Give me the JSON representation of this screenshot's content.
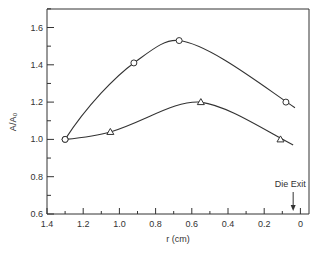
{
  "chart_data": {
    "type": "line",
    "title": "",
    "xlabel": "r (cm)",
    "ylabel": "A/A₀",
    "xlim": [
      1.4,
      0
    ],
    "ylim": [
      0.6,
      1.7
    ],
    "x_ticks": [
      "1.4",
      "1.2",
      "1.0",
      "0.8",
      "0.6",
      "0.4",
      "0.2",
      "0"
    ],
    "y_ticks": [
      "0.6",
      "0.8",
      "1.0",
      "1.2",
      "1.4",
      "1.6"
    ],
    "grid": false,
    "legend": null,
    "series": [
      {
        "name": "circles",
        "marker": "circle",
        "x": [
          1.3,
          0.92,
          0.67,
          0.08
        ],
        "y": [
          1.0,
          1.41,
          1.53,
          1.2
        ]
      },
      {
        "name": "triangles",
        "marker": "triangle",
        "x": [
          1.3,
          1.05,
          0.55,
          0.11
        ],
        "y": [
          1.0,
          1.04,
          1.2,
          1.0
        ]
      }
    ],
    "annotations": [
      {
        "text": "Die Exit",
        "x": 0.04,
        "arrow": "down"
      }
    ]
  }
}
